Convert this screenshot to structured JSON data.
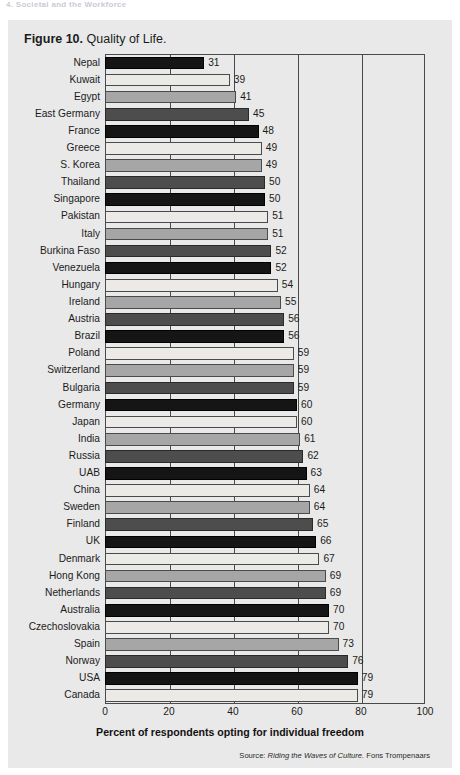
{
  "page_header": "4. Societal and the Workforce",
  "figure": {
    "label": "Figure 10.",
    "title": "Quality of Life."
  },
  "source_note": {
    "prefix": "Source:",
    "title": "Riding the Waves of Culture.",
    "author": "Fons Trompenaars"
  },
  "chart_data": {
    "type": "bar",
    "orientation": "horizontal",
    "title": "Quality of Life.",
    "xlabel": "Percent of respondents opting for individual freedom",
    "ylabel": "",
    "xlim": [
      0,
      100
    ],
    "xticks": [
      0,
      20,
      40,
      60,
      80,
      100
    ],
    "grid": true,
    "legend": "none",
    "bar_palette": [
      "#151515",
      "#eceae6",
      "#a6a6a6",
      "#4d4d4d"
    ],
    "categories": [
      "Nepal",
      "Kuwait",
      "Egypt",
      "East Germany",
      "France",
      "Greece",
      "S. Korea",
      "Thailand",
      "Singapore",
      "Pakistan",
      "Italy",
      "Burkina Faso",
      "Venezuela",
      "Hungary",
      "Ireland",
      "Austria",
      "Brazil",
      "Poland",
      "Switzerland",
      "Bulgaria",
      "Germany",
      "Japan",
      "India",
      "Russia",
      "UAB",
      "China",
      "Sweden",
      "Finland",
      "UK",
      "Denmark",
      "Hong Kong",
      "Netherlands",
      "Australia",
      "Czechoslovakia",
      "Spain",
      "Norway",
      "USA",
      "Canada"
    ],
    "values": [
      31,
      39,
      41,
      45,
      48,
      49,
      49,
      50,
      50,
      51,
      51,
      52,
      52,
      54,
      55,
      56,
      56,
      59,
      59,
      59,
      60,
      60,
      61,
      62,
      63,
      64,
      64,
      65,
      66,
      67,
      69,
      69,
      70,
      70,
      73,
      76,
      79,
      79
    ]
  }
}
